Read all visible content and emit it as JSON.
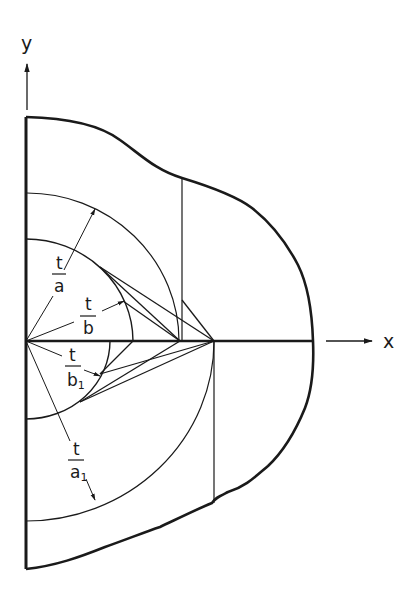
{
  "diagram": {
    "axes": {
      "x_label": "x",
      "y_label": "y"
    },
    "labels": {
      "t_over_a": {
        "num": "t",
        "den": "a"
      },
      "t_over_b": {
        "num": "t",
        "den": "b"
      },
      "t_over_b1": {
        "num": "t",
        "den": "b",
        "sub": "1"
      },
      "t_over_a1": {
        "num": "t",
        "den": "a",
        "sub": "1"
      }
    },
    "colors": {
      "stroke": "#1a1a1a",
      "background": "#ffffff"
    }
  }
}
